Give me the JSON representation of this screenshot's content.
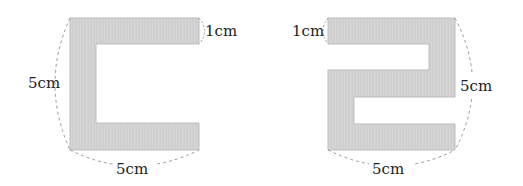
{
  "figures": [
    {
      "name": "c-shape",
      "labels": {
        "thickness": "1cm",
        "height": "5cm",
        "width": "5cm"
      }
    },
    {
      "name": "s-shape",
      "labels": {
        "thickness": "1cm",
        "height": "5cm",
        "width": "5cm"
      }
    }
  ],
  "colors": {
    "fill": "#d4d4d4",
    "stroke": "#b8b8b8",
    "dash": "#9a9a9a",
    "text": "#222222"
  }
}
